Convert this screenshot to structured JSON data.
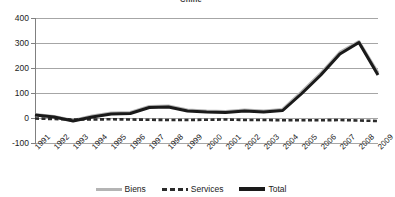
{
  "chart_data": {
    "type": "line",
    "title": "Chine",
    "xlabel": "",
    "ylabel": "",
    "ylim": [
      -100,
      400
    ],
    "yticks": [
      400,
      300,
      200,
      100,
      0,
      -100
    ],
    "ytick_labels": [
      "400",
      "300",
      "200",
      "100",
      "0",
      "-100"
    ],
    "grid": true,
    "legend_position": "bottom",
    "x": [
      1991,
      1992,
      1993,
      1994,
      1995,
      1996,
      1997,
      1998,
      1999,
      2000,
      2001,
      2002,
      2003,
      2004,
      2005,
      2006,
      2007,
      2008,
      2009
    ],
    "xtick_labels": [
      "1991",
      "1992",
      "1993",
      "1994",
      "1995",
      "1996",
      "1997",
      "1998",
      "1999",
      "2000",
      "2001",
      "2002",
      "2003",
      "2004",
      "2005",
      "2006",
      "2007",
      "2008",
      "2009"
    ],
    "series": [
      {
        "name": "Biens",
        "color": "#b4b4b4",
        "style": "solid",
        "values": [
          14,
          6,
          -10,
          8,
          20,
          22,
          46,
          48,
          32,
          28,
          26,
          32,
          28,
          34,
          104,
          178,
          262,
          305,
          180
        ]
      },
      {
        "name": "Services",
        "color": "#2b2b2b",
        "style": "dashed",
        "values": [
          -2,
          -4,
          -6,
          -6,
          -5,
          -6,
          -7,
          -8,
          -8,
          -7,
          -6,
          -8,
          -8,
          -9,
          -9,
          -9,
          -8,
          -10,
          -12
        ]
      },
      {
        "name": "Total",
        "color": "#1a1a1a",
        "style": "solid-thick",
        "values": [
          12,
          4,
          -12,
          4,
          16,
          18,
          42,
          44,
          28,
          24,
          22,
          28,
          24,
          30,
          98,
          172,
          256,
          302,
          172
        ]
      }
    ]
  },
  "legend": {
    "items": [
      {
        "label": "Biens",
        "marker": "line-solid-gray"
      },
      {
        "label": "Services",
        "marker": "line-dashed-dark"
      },
      {
        "label": "Total",
        "marker": "line-solid-black"
      }
    ]
  }
}
